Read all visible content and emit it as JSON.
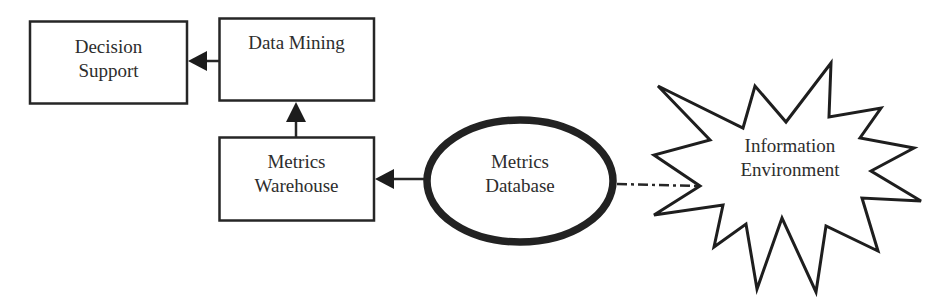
{
  "diagram": {
    "nodes": {
      "decision_support": {
        "line1": "Decision",
        "line2": "Support",
        "shape": "rectangle"
      },
      "data_mining": {
        "line1": "Data Mining",
        "shape": "rectangle"
      },
      "metrics_warehouse": {
        "line1": "Metrics",
        "line2": "Warehouse",
        "shape": "rectangle"
      },
      "metrics_database": {
        "line1": "Metrics",
        "line2": "Database",
        "shape": "ellipse"
      },
      "information_environment": {
        "line1": "Information",
        "line2": "Environment",
        "shape": "starburst"
      }
    },
    "edges": [
      {
        "from": "Data Mining",
        "to": "Decision Support",
        "style": "solid-arrow"
      },
      {
        "from": "Metrics Warehouse",
        "to": "Data Mining",
        "style": "solid-arrow"
      },
      {
        "from": "Metrics Database",
        "to": "Metrics Warehouse",
        "style": "solid-arrow"
      },
      {
        "from": "Metrics Database",
        "to": "Information Environment",
        "style": "dash-dot-line"
      }
    ],
    "colors": {
      "stroke": "#222222",
      "background": "#ffffff"
    }
  }
}
